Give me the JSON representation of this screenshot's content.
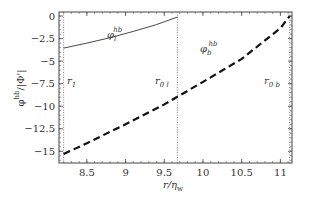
{
  "chart_data": {
    "type": "line",
    "title": "",
    "xlabel": "r/η_w",
    "ylabel": "φ^hb/|Φ'|",
    "xlim": [
      8.14,
      11.15
    ],
    "ylim": [
      -16.3,
      0.45
    ],
    "x_ticks": [
      8.5,
      9,
      9.5,
      10,
      10.5,
      11
    ],
    "x_tick_labels": [
      "8.5",
      "9",
      "9.5",
      "10",
      "10.5",
      "11"
    ],
    "y_ticks": [
      0,
      -2.5,
      -5,
      -7.5,
      -10,
      -12.5,
      -15
    ],
    "y_tick_labels": [
      "0",
      "−2.5",
      "−5",
      "−7.5",
      "−10",
      "−12.5",
      "−15"
    ],
    "grid": false,
    "series": [
      {
        "name": "φ_l^hb",
        "style": "solid",
        "color": "#333333",
        "x": [
          8.2,
          8.5,
          8.8,
          9.1,
          9.4,
          9.67
        ],
        "y": [
          -3.55,
          -3.0,
          -2.4,
          -1.7,
          -0.95,
          -0.1
        ]
      },
      {
        "name": "φ_b^hb",
        "style": "dashed",
        "color": "#111111",
        "x": [
          8.2,
          8.5,
          9.0,
          9.5,
          9.67,
          10.0,
          10.5,
          11.0,
          11.12
        ],
        "y": [
          -15.3,
          -14.1,
          -12.0,
          -9.8,
          -8.95,
          -7.3,
          -4.75,
          -1.35,
          0.0
        ]
      }
    ],
    "vertical_lines": [
      {
        "name": "r_1",
        "x": 8.2,
        "style": "dotted"
      },
      {
        "name": "r_0l",
        "x": 9.67,
        "style": "dotted"
      },
      {
        "name": "r_0b",
        "x": 11.12,
        "style": "dotted"
      }
    ],
    "annotations": [
      {
        "text": "r",
        "sub": "1",
        "x": 8.25,
        "y": -7.0
      },
      {
        "text": "r",
        "sub": "0 l",
        "x": 9.38,
        "y": -7.0
      },
      {
        "text": "r",
        "sub": "0 b",
        "x": 10.85,
        "y": -7.0
      },
      {
        "text": "φ",
        "sub": "l",
        "sup": "hb",
        "x": 8.85,
        "y": -1.9
      },
      {
        "text": "φ",
        "sub": "b",
        "sup": "hb",
        "x": 10.0,
        "y": -3.6
      }
    ]
  },
  "labels": {
    "xlabel_main": "r/η",
    "xlabel_sub": "w",
    "ylabel_main": "φ",
    "ylabel_sup": "hb",
    "ylabel_rest": "/|Φ'|",
    "phi_l": "φ",
    "phi_l_sub": "l",
    "phi_l_sup": "hb",
    "phi_b": "φ",
    "phi_b_sub": "b",
    "phi_b_sup": "hb",
    "r1": "r",
    "r1_sub": "1",
    "r0l": "r",
    "r0l_sub": "0 l",
    "r0b": "r",
    "r0b_sub": "0 b"
  }
}
